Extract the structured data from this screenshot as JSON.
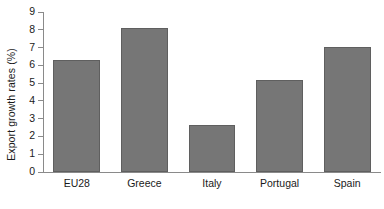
{
  "chart_data": {
    "type": "bar",
    "title": "",
    "subtitle": "",
    "xlabel": "",
    "ylabel": "Export growth rates (%)",
    "categories": [
      "EU28",
      "Greece",
      "Italy",
      "Portugal",
      "Spain"
    ],
    "values": [
      6.3,
      8.1,
      2.65,
      5.15,
      7.05
    ],
    "ylim": [
      0,
      9
    ],
    "ytick_values": [
      0,
      1,
      2,
      3,
      4,
      5,
      6,
      7,
      8,
      9
    ],
    "ytick_labels": [
      "0",
      "1",
      "2",
      "3",
      "4",
      "5",
      "6",
      "7",
      "8",
      "9"
    ],
    "grid": false,
    "legend": null,
    "bar_color": "#767676",
    "bar_edge_color": "#5f5f5f",
    "axis_color": "#8a8a8a",
    "background_color": "#ffffff",
    "annotations": []
  }
}
